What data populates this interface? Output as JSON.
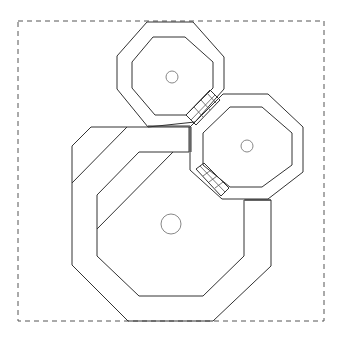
{
  "diagram": {
    "type": "floor-plan",
    "colors": {
      "line": "#333333",
      "boundary": "#555555",
      "column": "#888888",
      "background": "#ffffff"
    },
    "boundary": {
      "x": 18,
      "y": 21,
      "width": 306,
      "height": 300,
      "style": "dashed"
    },
    "rooms": [
      {
        "id": "top-octagon",
        "shape": "octagon-ring",
        "outer": [
          [
            147,
            22
          ],
          [
            193,
            22
          ],
          [
            224,
            57
          ],
          [
            224,
            89
          ],
          [
            193,
            124
          ],
          [
            148,
            127
          ],
          [
            117,
            89
          ],
          [
            117,
            56
          ]
        ],
        "inner": [
          [
            153,
            37
          ],
          [
            185,
            37
          ],
          [
            213,
            62
          ],
          [
            213,
            88
          ],
          [
            185,
            115
          ],
          [
            155,
            115
          ],
          [
            132,
            88
          ],
          [
            132,
            62
          ]
        ],
        "center_column": {
          "cx": 172,
          "cy": 77,
          "r": 6
        }
      },
      {
        "id": "right-octagon",
        "shape": "octagon-ring",
        "outer": [
          [
            223,
            94
          ],
          [
            268,
            94
          ],
          [
            303,
            127
          ],
          [
            303,
            172
          ],
          [
            268,
            199
          ],
          [
            222,
            199
          ],
          [
            190,
            170
          ],
          [
            190,
            127
          ]
        ],
        "inner": [
          [
            230,
            107
          ],
          [
            262,
            107
          ],
          [
            292,
            133
          ],
          [
            292,
            165
          ],
          [
            262,
            187
          ],
          [
            230,
            187
          ],
          [
            203,
            165
          ],
          [
            203,
            133
          ]
        ],
        "center_column": {
          "cx": 247,
          "cy": 146,
          "r": 6
        }
      },
      {
        "id": "large-octagon",
        "shape": "octagon-ring",
        "outer": [
          [
            91,
            127
          ],
          [
            190,
            127
          ],
          [
            190,
            152
          ],
          [
            190,
            170
          ],
          [
            222,
            199
          ],
          [
            271,
            200
          ],
          [
            271,
            266
          ],
          [
            213,
            320
          ],
          [
            128,
            321
          ],
          [
            72,
            265
          ],
          [
            72,
            146
          ]
        ],
        "inner": [
          [
            139,
            152
          ],
          [
            189,
            152
          ],
          [
            189,
            170
          ],
          [
            222,
            199
          ],
          [
            244,
            200
          ],
          [
            244,
            256
          ],
          [
            203,
            296
          ],
          [
            139,
            296
          ],
          [
            97,
            256
          ],
          [
            97,
            195
          ]
        ],
        "center_column": {
          "cx": 171,
          "cy": 224,
          "r": 10
        }
      }
    ],
    "connectors": [
      {
        "id": "connector-top-right",
        "from": "top-octagon",
        "to": "right-octagon",
        "segments": 3
      },
      {
        "id": "connector-right-bottom",
        "from": "right-octagon",
        "to": "large-octagon",
        "segments": 3
      }
    ]
  }
}
